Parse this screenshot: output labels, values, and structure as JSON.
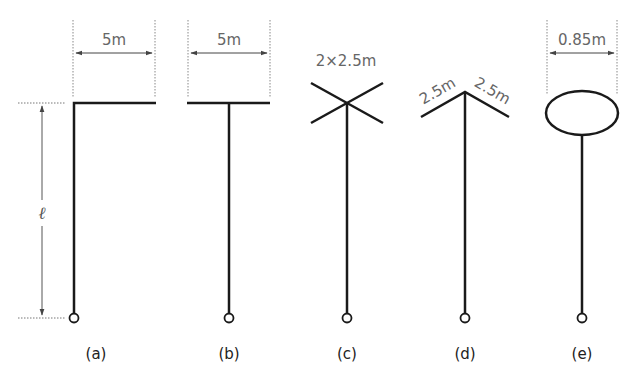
{
  "diagram": {
    "panels": [
      {
        "id": "a",
        "caption": "(a)",
        "dimension_label": "5m",
        "shape": "inverted-L"
      },
      {
        "id": "b",
        "caption": "(b)",
        "dimension_label": "5m",
        "shape": "T"
      },
      {
        "id": "c",
        "caption": "(c)",
        "dimension_label": "2×2.5m",
        "shape": "X-cross"
      },
      {
        "id": "d",
        "caption": "(d)",
        "dimension_labels": [
          "2.5m",
          "2.5m"
        ],
        "shape": "inverted-V"
      },
      {
        "id": "e",
        "caption": "(e)",
        "dimension_label": "0.85m",
        "shape": "loop"
      }
    ],
    "height_label": "ℓ",
    "colors": {
      "line": "#1a1a1a",
      "dimension": "#666666"
    }
  }
}
